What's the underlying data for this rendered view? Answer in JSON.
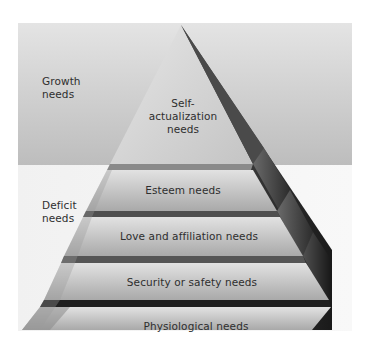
{
  "diagram": {
    "type": "pyramid",
    "zones": [
      {
        "label_line1": "Growth",
        "label_line2": "needs"
      },
      {
        "label_line1": "Deficit",
        "label_line2": "needs"
      }
    ],
    "tiers": [
      {
        "line1": "Self-",
        "line2": "actualization",
        "line3": "needs"
      },
      {
        "label": "Esteem needs"
      },
      {
        "label": "Love and affiliation needs"
      },
      {
        "label": "Security or safety needs"
      },
      {
        "label": "Physiological needs"
      }
    ],
    "colors": {
      "growth_panel": "#c9c9c9",
      "deficit_panel": "#f2f2f2",
      "tier_face": "#b8b8b8",
      "tier_shadow": "#3a3a3a",
      "side_facet": "#2a2a2a",
      "text": "#2e2e2e"
    }
  }
}
